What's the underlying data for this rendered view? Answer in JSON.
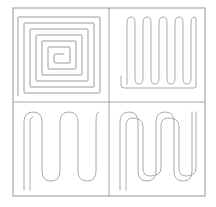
{
  "figure": {
    "layout": "2x2 grid of line-art panels",
    "background_color": "#ffffff",
    "line_color": "#8a8a8a",
    "frame_color": "#8d8d8d",
    "panel_count": 4
  },
  "frame": {
    "x": 13,
    "y": 8,
    "width": 192,
    "height": 188
  },
  "dividers": {
    "vertical_x": 109,
    "horizontal_y": 102
  },
  "panels": [
    {
      "id": "panel-top-left",
      "name": "square-spiral",
      "label": "Square spiral",
      "turns": 6,
      "entry": "bottom-left",
      "center_shape": "hook",
      "bounds": {
        "x": 13,
        "y": 8,
        "width": 96,
        "height": 94
      }
    },
    {
      "id": "panel-top-right",
      "name": "fine-serpentine",
      "label": "Fine serpentine",
      "fingers": 7,
      "orientation": "vertical",
      "bend_style": "rounded",
      "lead_out": "bottom-left",
      "bounds": {
        "x": 109,
        "y": 8,
        "width": 96,
        "height": 94
      }
    },
    {
      "id": "panel-bottom-left",
      "name": "coarse-serpentine",
      "label": "Coarse serpentine",
      "fingers": 4,
      "orientation": "vertical",
      "bend_style": "rounded",
      "lead_out": "bottom-left",
      "bounds": {
        "x": 13,
        "y": 102,
        "width": 96,
        "height": 94
      }
    },
    {
      "id": "panel-bottom-right",
      "name": "double-serpentine",
      "label": "Double serpentine",
      "fingers": 4,
      "paths": 2,
      "orientation": "vertical",
      "bend_style": "rounded",
      "lead_out": "left-edge-vertical",
      "bounds": {
        "x": 109,
        "y": 102,
        "width": 96,
        "height": 94
      }
    }
  ],
  "geometry": {
    "spiral": {
      "rings": [
        {
          "x1": 22,
          "y1": 17,
          "x2": 100,
          "y2": 93
        },
        {
          "x1": 28,
          "y1": 23,
          "x2": 94,
          "y2": 87
        },
        {
          "x1": 34,
          "y1": 29,
          "x2": 88,
          "y2": 81
        },
        {
          "x1": 40,
          "y1": 35,
          "x2": 82,
          "y2": 75
        },
        {
          "x1": 46,
          "y1": 41,
          "x2": 76,
          "y2": 69
        },
        {
          "x1": 52,
          "y1": 47,
          "x2": 70,
          "y2": 63
        }
      ],
      "lead_x": 18,
      "lead_bottom_y": 96
    },
    "serpentine_fine": {
      "left": 127,
      "right": 196,
      "top": 17,
      "bottom": 84,
      "fingers": 7,
      "lead_x": 121,
      "lead_y": 90
    },
    "serpentine_coarse": {
      "left": 30,
      "right": 98,
      "top": 112,
      "bottom": 181,
      "fingers": 4,
      "lead_x": 24,
      "lead_y": 190
    },
    "serpentine_double": {
      "left": 126,
      "right": 196,
      "top": 112,
      "bottom": 181,
      "fingers": 4,
      "lead_x": 120,
      "offset": 4
    }
  }
}
